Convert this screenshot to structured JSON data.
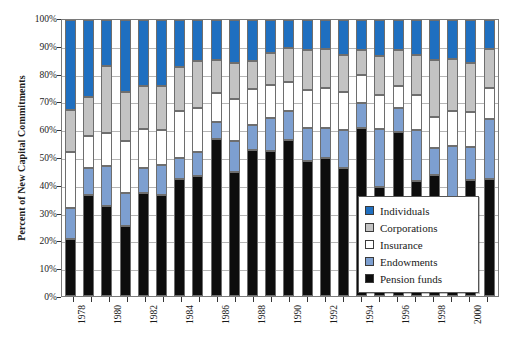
{
  "chart_data": {
    "type": "bar",
    "subtype": "stacked-column-100percent",
    "title": "",
    "xlabel": "",
    "ylabel": "Percent of New Capital Commitments",
    "ylim": [
      0,
      100
    ],
    "ytick_labels": [
      "0%",
      "10%",
      "20%",
      "30%",
      "40%",
      "50%",
      "60%",
      "70%",
      "80%",
      "90%",
      "100%"
    ],
    "ytick_values": [
      0,
      10,
      20,
      30,
      40,
      50,
      60,
      70,
      80,
      90,
      100
    ],
    "grid": true,
    "legend_position": "inside-bottom-right",
    "categories": [
      "1978",
      "1979",
      "1980",
      "1981",
      "1982",
      "1983",
      "1984",
      "1985",
      "1986",
      "1987",
      "1988",
      "1989",
      "1990",
      "1991",
      "1992",
      "1993",
      "1994",
      "1995",
      "1996",
      "1997",
      "1998",
      "1999",
      "2000",
      "2001"
    ],
    "xtick_labels_shown": [
      "1978",
      "1980",
      "1982",
      "1984",
      "1986",
      "1988",
      "1990",
      "1992",
      "1994",
      "1996",
      "1998",
      "2000"
    ],
    "series": [
      {
        "name": "Pension funds",
        "color": "#0d0d0d",
        "values": [
          20.5,
          36.5,
          32.5,
          25.5,
          37.5,
          36.5,
          42.5,
          43.5,
          57.0,
          45.0,
          53.0,
          52.5,
          56.5,
          49.0,
          50.0,
          46.5,
          61.0,
          39.5,
          59.5,
          41.5,
          44.0,
          32.0,
          42.0,
          42.5
        ]
      },
      {
        "name": "Endowments",
        "color": "#7d9fd0",
        "values": [
          11.5,
          10.0,
          14.5,
          12.0,
          9.0,
          11.0,
          7.5,
          8.5,
          6.0,
          11.0,
          9.0,
          12.0,
          10.5,
          12.0,
          11.0,
          13.5,
          9.0,
          21.0,
          8.5,
          18.5,
          9.5,
          22.5,
          12.0,
          21.5
        ]
      },
      {
        "name": "Insurance",
        "color": "#ffffff",
        "values": [
          20.0,
          11.5,
          12.0,
          18.5,
          14.0,
          12.5,
          17.0,
          16.0,
          10.5,
          15.5,
          13.0,
          12.0,
          10.5,
          13.5,
          14.5,
          14.0,
          10.0,
          12.5,
          8.0,
          13.0,
          11.5,
          12.5,
          12.5,
          11.5
        ]
      },
      {
        "name": "Corporations",
        "color": "#c3c3c3",
        "values": [
          15.5,
          14.0,
          24.5,
          18.0,
          15.5,
          16.0,
          16.0,
          17.0,
          12.0,
          13.0,
          10.0,
          11.5,
          12.5,
          14.5,
          14.0,
          13.5,
          9.0,
          14.0,
          13.0,
          14.5,
          20.5,
          19.0,
          18.0,
          14.0
        ]
      },
      {
        "name": "Individuals",
        "color": "#1f6fc0",
        "values": [
          32.5,
          28.0,
          16.5,
          26.0,
          24.0,
          24.0,
          17.0,
          15.0,
          14.5,
          15.5,
          15.0,
          12.0,
          10.0,
          11.0,
          10.5,
          12.5,
          11.0,
          13.0,
          11.0,
          12.5,
          14.5,
          14.0,
          15.5,
          10.5
        ]
      }
    ]
  },
  "legend": {
    "items": [
      {
        "label": "Individuals",
        "color": "#1f6fc0"
      },
      {
        "label": "Corporations",
        "color": "#c3c3c3"
      },
      {
        "label": "Insurance",
        "color": "#ffffff"
      },
      {
        "label": "Endowments",
        "color": "#7d9fd0"
      },
      {
        "label": "Pension funds",
        "color": "#0d0d0d"
      }
    ]
  },
  "axes": {
    "y_title": "Percent of New Capital Commitments"
  }
}
